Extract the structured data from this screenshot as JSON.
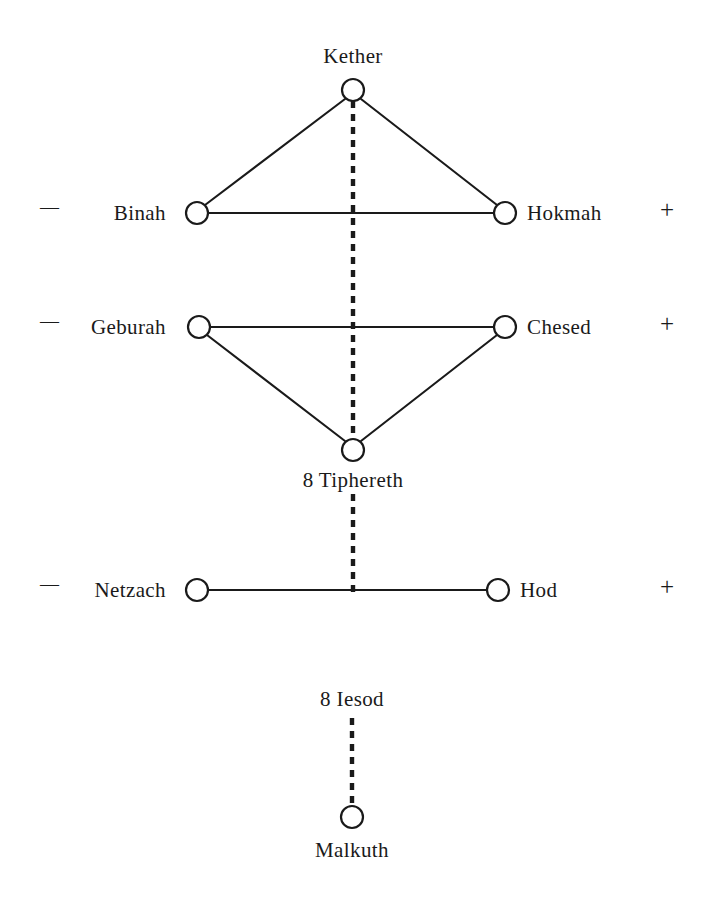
{
  "diagram": {
    "background_color": "#ffffff",
    "ink_color": "#1a1a1a",
    "width": 707,
    "height": 899,
    "nodes": [
      {
        "id": "kether",
        "label": "Kether",
        "label_position": "above",
        "cx": 353,
        "cy": 90,
        "r": 11,
        "label_x": 353,
        "label_y": 46
      },
      {
        "id": "binah",
        "label": "Binah",
        "label_position": "left",
        "cx": 197,
        "cy": 213,
        "r": 11,
        "label_x": 166,
        "label_y": 203
      },
      {
        "id": "hokmah",
        "label": "Hokmah",
        "label_position": "right",
        "cx": 505,
        "cy": 213,
        "r": 11,
        "label_x": 527,
        "label_y": 203
      },
      {
        "id": "geburah",
        "label": "Geburah",
        "label_position": "left",
        "cx": 199,
        "cy": 327,
        "r": 11,
        "label_x": 166,
        "label_y": 317
      },
      {
        "id": "chesed",
        "label": "Chesed",
        "label_position": "right",
        "cx": 505,
        "cy": 327,
        "r": 11,
        "label_x": 527,
        "label_y": 317
      },
      {
        "id": "tiphereth",
        "label": "8 Tiphereth",
        "label_position": "below",
        "cx": 353,
        "cy": 450,
        "r": 11,
        "label_x": 353,
        "label_y": 470
      },
      {
        "id": "netzach",
        "label": "Netzach",
        "label_position": "left",
        "cx": 197,
        "cy": 590,
        "r": 11,
        "label_x": 166,
        "label_y": 580
      },
      {
        "id": "hod",
        "label": "Hod",
        "label_position": "right",
        "cx": 498,
        "cy": 590,
        "r": 11,
        "label_x": 520,
        "label_y": 580
      },
      {
        "id": "iesod",
        "label": "8 Iesod",
        "label_position": "standalone",
        "cx": 352,
        "cy": 700,
        "r": 0,
        "label_x": 352,
        "label_y": 689
      },
      {
        "id": "malkuth",
        "label": "Malkuth",
        "label_position": "below",
        "cx": 352,
        "cy": 817,
        "r": 11,
        "label_x": 352,
        "label_y": 840
      }
    ],
    "solid_paths": [
      {
        "id": "kether-binah",
        "from": "kether",
        "to": "binah",
        "x1": 345,
        "y1": 99,
        "x2": 205,
        "y2": 205
      },
      {
        "id": "kether-hokmah",
        "from": "kether",
        "to": "hokmah",
        "x1": 361,
        "y1": 99,
        "x2": 497,
        "y2": 205
      },
      {
        "id": "binah-hokmah",
        "from": "binah",
        "to": "hokmah",
        "x1": 208,
        "y1": 213,
        "x2": 494,
        "y2": 213
      },
      {
        "id": "geburah-chesed",
        "from": "geburah",
        "to": "chesed",
        "x1": 210,
        "y1": 327,
        "x2": 494,
        "y2": 327
      },
      {
        "id": "geburah-tiphereth",
        "from": "geburah",
        "to": "tiphereth",
        "x1": 207,
        "y1": 335,
        "x2": 345,
        "y2": 441
      },
      {
        "id": "chesed-tiphereth",
        "from": "chesed",
        "to": "tiphereth",
        "x1": 497,
        "y1": 335,
        "x2": 361,
        "y2": 441
      },
      {
        "id": "netzach-hod",
        "from": "netzach",
        "to": "hod",
        "x1": 208,
        "y1": 590,
        "x2": 487,
        "y2": 590
      }
    ],
    "dashed_paths": [
      {
        "id": "kether-tiphereth-dashed",
        "x1": 353,
        "y1": 101,
        "x2": 353,
        "y2": 439
      },
      {
        "id": "tiphereth-netzachhod-dashed",
        "x1": 353,
        "y1": 494,
        "x2": 353,
        "y2": 592
      },
      {
        "id": "iesod-malkuth-dashed",
        "x1": 352,
        "y1": 718,
        "x2": 352,
        "y2": 804
      }
    ],
    "polarity_rows": [
      {
        "id": "row-binah-hokmah",
        "y": 213,
        "left_sign": "—",
        "right_sign": "+",
        "left_x": 40,
        "right_x": 660
      },
      {
        "id": "row-geburah-chesed",
        "y": 327,
        "left_sign": "—",
        "right_sign": "+",
        "left_x": 40,
        "right_x": 660
      },
      {
        "id": "row-netzach-hod",
        "y": 590,
        "left_sign": "—",
        "right_sign": "+",
        "left_x": 40,
        "right_x": 660
      }
    ]
  }
}
